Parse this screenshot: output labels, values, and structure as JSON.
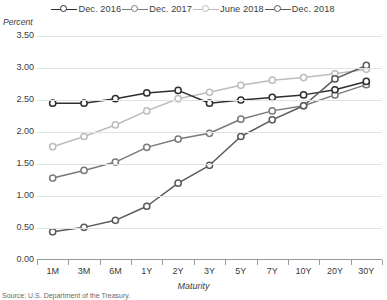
{
  "legend": {
    "items": [
      {
        "label": "Dec. 2016",
        "color": "#2f2f2f"
      },
      {
        "label": "Dec. 2017",
        "color": "#7a7a7a"
      },
      {
        "label": "June 2018",
        "color": "#bdbdbd"
      },
      {
        "label": "Dec. 2018",
        "color": "#5a5a5a"
      }
    ]
  },
  "axes": {
    "ylabel": "Percent",
    "xlabel": "Maturity",
    "yticks": [
      "0.00",
      "0.50",
      "1.00",
      "1.50",
      "2.00",
      "2.50",
      "3.00",
      "3.50"
    ]
  },
  "source": "Source: U.S. Department of the Treasury.",
  "chart_data": {
    "type": "line",
    "title": "",
    "xlabel": "Maturity",
    "ylabel": "Percent",
    "ylim": [
      0.0,
      3.5
    ],
    "ytick_step": 0.5,
    "grid": true,
    "legend_position": "top",
    "categories": [
      "1M",
      "3M",
      "6M",
      "1Y",
      "2Y",
      "3Y",
      "5Y",
      "7Y",
      "10Y",
      "20Y",
      "30Y"
    ],
    "series": [
      {
        "name": "Dec. 2016",
        "color": "#2f2f2f",
        "values": [
          2.45,
          2.45,
          2.52,
          2.61,
          2.65,
          2.45,
          2.5,
          2.54,
          2.58,
          2.66,
          2.79
        ]
      },
      {
        "name": "Dec. 2017",
        "color": "#7a7a7a",
        "values": [
          1.28,
          1.4,
          1.53,
          1.76,
          1.89,
          1.98,
          2.2,
          2.33,
          2.41,
          2.58,
          2.74
        ]
      },
      {
        "name": "June 2018",
        "color": "#bdbdbd",
        "values": [
          1.77,
          1.93,
          2.11,
          2.33,
          2.52,
          2.62,
          2.73,
          2.81,
          2.85,
          2.91,
          2.98
        ]
      },
      {
        "name": "Dec. 2018",
        "color": "#5a5a5a",
        "values": [
          0.44,
          0.51,
          0.62,
          0.84,
          1.2,
          1.48,
          1.93,
          2.19,
          2.41,
          2.83,
          3.04
        ]
      }
    ]
  }
}
